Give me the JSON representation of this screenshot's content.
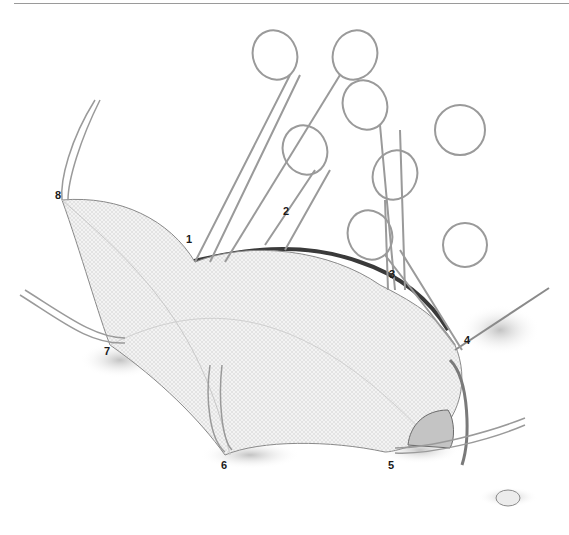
{
  "figure": {
    "colors": {
      "line": "#8a8a8a",
      "dark_line": "#3a3a3a",
      "gauze": "#f1f1f1",
      "tissue_dark": "#4a4a4a",
      "rule": "#9a9a9a"
    },
    "labels": [
      {
        "id": "1",
        "text": "1",
        "x": 186,
        "y": 240
      },
      {
        "id": "2",
        "text": "2",
        "x": 283,
        "y": 212
      },
      {
        "id": "3",
        "text": "3",
        "x": 389,
        "y": 275
      },
      {
        "id": "4",
        "text": "4",
        "x": 464,
        "y": 341
      },
      {
        "id": "5",
        "text": "5",
        "x": 388,
        "y": 466
      },
      {
        "id": "6",
        "text": "6",
        "x": 221,
        "y": 466
      },
      {
        "id": "7",
        "text": "7",
        "x": 104,
        "y": 352
      },
      {
        "id": "8",
        "text": "8",
        "x": 55,
        "y": 196
      }
    ]
  }
}
